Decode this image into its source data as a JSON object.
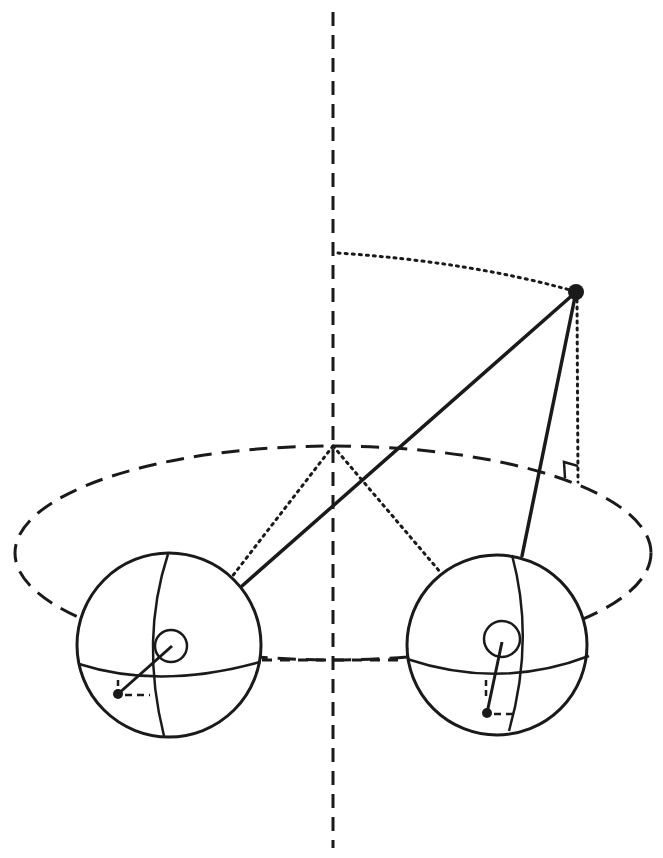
{
  "canvas": {
    "width": 663,
    "height": 858,
    "background": "#ffffff",
    "ink": "#1a1a1a"
  },
  "axis": {
    "x": 333,
    "y1": 12,
    "y2": 848,
    "dash": "14 9",
    "width": 3
  },
  "orbit_ellipse": {
    "cx": 333,
    "cy": 553,
    "rx": 318,
    "ry": 107,
    "dash": "18 10",
    "width": 3
  },
  "point": {
    "cx": 576,
    "cy": 292,
    "r": 8
  },
  "height_arc": {
    "path": "M338 253 Q470 262 570 290",
    "dash": "2 5",
    "width": 3
  },
  "drop_line": {
    "x1": 577,
    "y1": 300,
    "x2": 578,
    "y2": 482,
    "dash": "2 5",
    "width": 3
  },
  "right_angle_marker": {
    "path": "M565 478 L564 462 L578 466"
  },
  "spheres": [
    {
      "name": "left",
      "cx": 169,
      "cy": 645,
      "r": 92,
      "meridian": "M168 554 Q140 640 164 736",
      "equator": "M79 664 Q160 690 260 662",
      "inner_circle": {
        "cx": 171,
        "cy": 646,
        "r": 16
      },
      "spin_line": {
        "x1": 118,
        "y1": 694,
        "x2": 172,
        "y2": 646
      },
      "spin_dot": {
        "cx": 118,
        "cy": 694,
        "r": 5
      },
      "dash_h": {
        "x1": 125,
        "y1": 695,
        "x2": 150,
        "y2": 695
      },
      "dash_v": {
        "x1": 118,
        "y1": 680,
        "x2": 118,
        "y2": 688
      }
    },
    {
      "name": "right",
      "cx": 497,
      "cy": 645,
      "r": 90,
      "meridian": "M512 555 Q535 640 509 731",
      "equator": "M407 659 Q500 690 589 656",
      "inner_circle": {
        "cx": 502,
        "cy": 639,
        "r": 18
      },
      "spin_line": {
        "x1": 487,
        "y1": 713,
        "x2": 502,
        "y2": 642
      },
      "spin_dot": {
        "cx": 487,
        "cy": 713,
        "r": 5
      },
      "dash_h": {
        "x1": 494,
        "y1": 714,
        "x2": 518,
        "y2": 714
      },
      "dash_v": {
        "x1": 486,
        "y1": 680,
        "x2": 486,
        "y2": 700
      }
    }
  ],
  "string_lines": [
    {
      "name": "point-to-left-sphere",
      "x1": 576,
      "y1": 292,
      "x2": 242,
      "y2": 586
    },
    {
      "name": "point-to-right-sphere",
      "x1": 576,
      "y1": 292,
      "x2": 522,
      "y2": 556
    }
  ],
  "radius_lines": [
    {
      "name": "axis-to-left-sphere",
      "x1": 333,
      "y1": 446,
      "x2": 231,
      "y2": 578
    },
    {
      "name": "axis-to-right-sphere",
      "x1": 333,
      "y1": 446,
      "x2": 441,
      "y2": 573
    }
  ],
  "sphere_link": {
    "x1": 262,
    "y1": 660,
    "x2": 406,
    "y2": 660,
    "dash": "10 8"
  }
}
